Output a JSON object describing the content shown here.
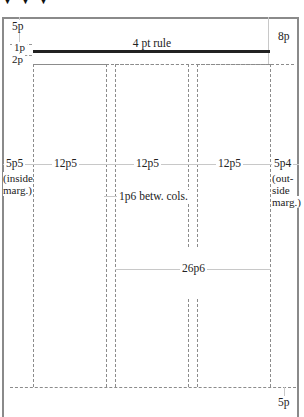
{
  "diagram": {
    "title_arrows": [
      "arrow-1",
      "arrow-2",
      "arrow-3"
    ],
    "rule": {
      "label": "4 pt rule"
    },
    "top_margins": {
      "top": "5p",
      "rule_space": "1p",
      "below_rule": "2p",
      "top_right": "8p"
    },
    "columns": [
      {
        "width_label": "12p5"
      },
      {
        "width_label": "12p5"
      },
      {
        "width_label": "12p5"
      }
    ],
    "gutter_label": "1p6 betw. cols.",
    "inside_margin": {
      "value": "5p5",
      "note_line1": "(inside",
      "note_line2": "marg.)"
    },
    "outside_margin": {
      "value": "5p4",
      "note_line1": "(out-",
      "note_line2": "side",
      "note_line3": "marg.)"
    },
    "span_label": "26p6",
    "bottom_margin": "5p",
    "colors": {
      "border": "#8a8a8a",
      "dash": "#8c8c8c",
      "rule": "#222222",
      "dimension_line": "#c8c8c8"
    }
  }
}
